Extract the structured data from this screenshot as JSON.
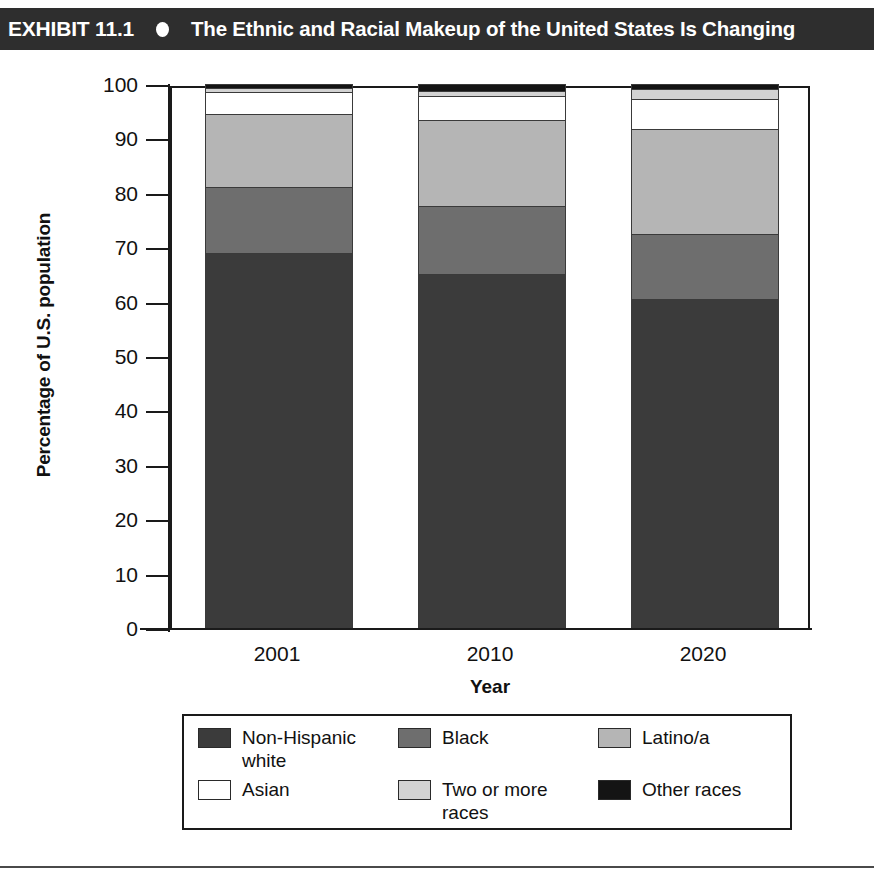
{
  "header": {
    "exhibit_label": "EXHIBIT 11.1",
    "bullet_icon": "bullet-dot-icon",
    "title": "The Ethnic and Racial Makeup of the United States Is Changing",
    "background_color": "#2e2e2e",
    "text_color": "#ffffff"
  },
  "chart_data": {
    "type": "bar",
    "subtype": "stacked-100-percent",
    "title": "The Ethnic and Racial Makeup of the United States Is Changing",
    "xlabel": "Year",
    "ylabel": "Percentage of U.S. population",
    "categories": [
      "2001",
      "2010",
      "2020"
    ],
    "ylim": [
      0,
      100
    ],
    "yticks": [
      0,
      10,
      20,
      30,
      40,
      50,
      60,
      70,
      80,
      90,
      100
    ],
    "grid": false,
    "legend_position": "bottom",
    "series": [
      {
        "name": "Non-Hispanic white",
        "color": "#3b3b3b",
        "values": [
          69.0,
          65.0,
          60.5
        ]
      },
      {
        "name": "Black",
        "color": "#6e6e6e",
        "values": [
          12.0,
          12.5,
          12.0
        ]
      },
      {
        "name": "Latino/a",
        "color": "#b5b5b5",
        "values": [
          13.5,
          15.8,
          19.3
        ]
      },
      {
        "name": "Asian",
        "color": "#ffffff",
        "values": [
          4.0,
          4.5,
          5.5
        ]
      },
      {
        "name": "Two or more races",
        "color": "#d2d2d2",
        "values": [
          0.8,
          1.0,
          1.8
        ]
      },
      {
        "name": "Other races",
        "color": "#141414",
        "values": [
          0.7,
          1.2,
          0.9
        ]
      }
    ]
  },
  "legend": {
    "items": [
      {
        "label": "Non-Hispanic white",
        "color": "#3b3b3b"
      },
      {
        "label": "Black",
        "color": "#6e6e6e"
      },
      {
        "label": "Latino/a",
        "color": "#b5b5b5"
      },
      {
        "label": "Asian",
        "color": "#ffffff"
      },
      {
        "label": "Two or more races",
        "color": "#d2d2d2"
      },
      {
        "label": "Other races",
        "color": "#141414"
      }
    ]
  }
}
